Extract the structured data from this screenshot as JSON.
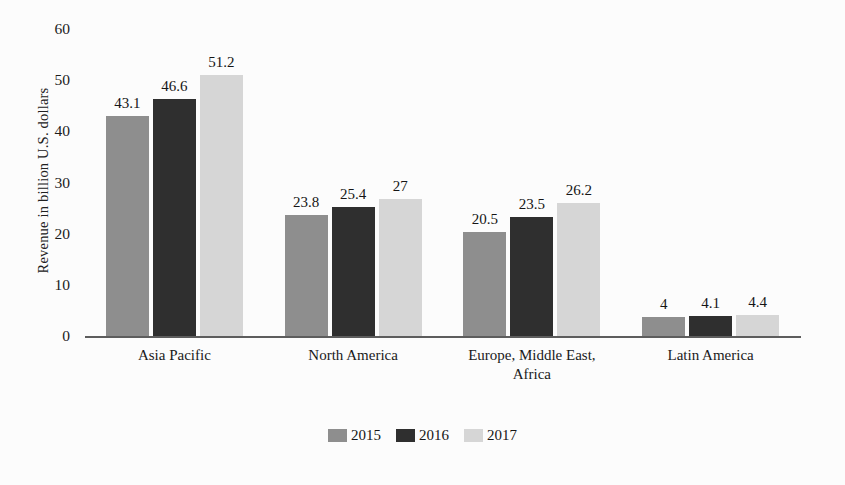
{
  "chart_data": {
    "type": "bar",
    "title": "",
    "subtitle": "",
    "xlabel": "",
    "ylabel": "Revenue in billion U.S. dollars",
    "ylim": [
      0,
      60
    ],
    "yticks": [
      0,
      10,
      20,
      30,
      40,
      50,
      60
    ],
    "ytick_labels": [
      "0",
      "10",
      "20",
      "30",
      "40",
      "50",
      "60"
    ],
    "grid": false,
    "legend_position": "bottom-center",
    "categories": [
      "Asia Pacific",
      "North America",
      "Europe, Middle East, Africa",
      "Latin America"
    ],
    "category_lines": [
      [
        "Asia Pacific"
      ],
      [
        "North America"
      ],
      [
        "Europe, Middle East,",
        "Africa"
      ],
      [
        "Latin America"
      ]
    ],
    "series": [
      {
        "name": "2015",
        "color": "#8e8e8e",
        "values": [
          43.1,
          23.8,
          20.5,
          4
        ],
        "labels": [
          "43.1",
          "23.8",
          "20.5",
          "4"
        ]
      },
      {
        "name": "2016",
        "color": "#2f2f2f",
        "values": [
          46.6,
          25.4,
          23.5,
          4.1
        ],
        "labels": [
          "46.6",
          "25.4",
          "23.5",
          "4.1"
        ]
      },
      {
        "name": "2017",
        "color": "#d6d6d6",
        "values": [
          51.2,
          27,
          26.2,
          4.4
        ],
        "labels": [
          "51.2",
          "27",
          "26.2",
          "4.4"
        ]
      }
    ]
  },
  "legend": {
    "items": [
      {
        "label": "2015",
        "color": "#8e8e8e"
      },
      {
        "label": "2016",
        "color": "#2f2f2f"
      },
      {
        "label": "2017",
        "color": "#d6d6d6"
      }
    ]
  },
  "colors": {
    "background": "#fcfcfc",
    "axis": "#5d5d5d",
    "text": "#1c1c1c",
    "series_2015": "#8e8e8e",
    "series_2016": "#2f2f2f",
    "series_2017": "#d6d6d6"
  }
}
